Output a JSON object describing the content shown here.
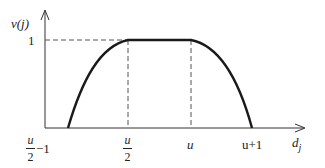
{
  "diagram": {
    "y_label": "v(j)",
    "x_label": "d_j",
    "x_label_base": "d",
    "x_label_sub": "j",
    "y_tick": "1",
    "x_ticks": [
      {
        "numerator": "u",
        "denominator": "2",
        "suffix": "−1"
      },
      {
        "numerator": "u",
        "denominator": "2",
        "suffix": ""
      },
      {
        "text": "u"
      },
      {
        "text": "u+1"
      }
    ],
    "curve": "trapezoidal membership: rises from u/2−1 to 1 at u/2, flat to u, falls to 0 at u+1",
    "colors": {
      "curve": "#1a1a1a",
      "axis": "#333333",
      "dashed": "#555555"
    }
  }
}
